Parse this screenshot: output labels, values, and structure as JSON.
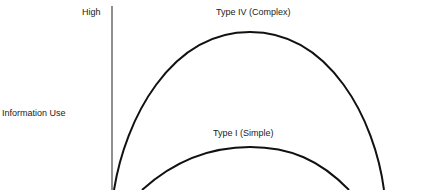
{
  "diagram": {
    "y_axis": {
      "title": "Information Use",
      "top_label": "High"
    },
    "curves": [
      {
        "label": "Type IV (Complex)",
        "peak": "high"
      },
      {
        "label": "Type I (Simple)",
        "peak": "lower"
      }
    ],
    "colors": {
      "line": "#111111",
      "axis": "#444444",
      "text": "#222222"
    }
  }
}
